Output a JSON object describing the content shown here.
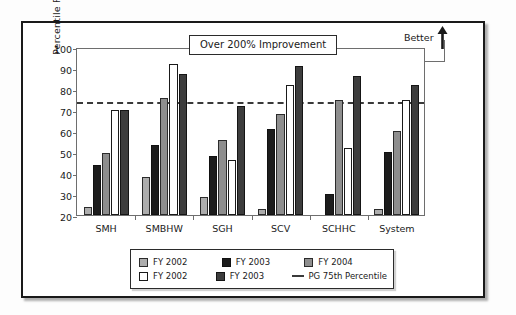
{
  "chart_data": {
    "type": "bar",
    "title": "",
    "xlabel": "",
    "ylabel": "Percentile Ranking",
    "ylim": [
      20,
      100
    ],
    "ytick_step": 10,
    "yticks": [
      20,
      30,
      40,
      50,
      60,
      70,
      80,
      90,
      100
    ],
    "grid": false,
    "legend_position": "bottom",
    "categories": [
      "SMH",
      "SMBHW",
      "SGH",
      "SCV",
      "SCHHC",
      "System"
    ],
    "series": [
      {
        "name": "FY 2002",
        "style": "light-gray-fill",
        "color": "#adadad",
        "values": [
          24,
          38,
          28.5,
          23,
          null,
          23
        ]
      },
      {
        "name": "FY 2003",
        "style": "black-fill",
        "color": "#1c1c1c",
        "values": [
          44,
          53.5,
          48,
          61,
          30,
          50
        ]
      },
      {
        "name": "FY 2004",
        "style": "mid-gray-fill",
        "color": "#8e8e8e",
        "values": [
          49.5,
          75.5,
          55.5,
          68,
          75,
          60
        ]
      },
      {
        "name": "FY 2002",
        "style": "white-fill",
        "color": "#ffffff",
        "values": [
          70,
          92,
          46,
          82,
          52,
          75
        ]
      },
      {
        "name": "FY 2003",
        "style": "dark-gray-fill",
        "color": "#3d3d3d",
        "values": [
          70,
          87,
          72,
          91,
          86,
          82
        ]
      }
    ],
    "reference_line": {
      "label": "PG 75th Percentile",
      "value": 75,
      "style": "dashed",
      "color": "#3a3a3a"
    },
    "annotations": [
      {
        "name": "improvement-callout",
        "text": "Over 200% Improvement"
      },
      {
        "name": "better-direction",
        "text": "Better",
        "icon": "up-arrow-icon"
      }
    ]
  },
  "legend": {
    "rows": [
      [
        {
          "label": "FY 2002",
          "swatch": "light-gray-fill"
        },
        {
          "label": "FY 2003",
          "swatch": "black-fill"
        },
        {
          "label": "FY 2004",
          "swatch": "mid-gray-fill"
        }
      ],
      [
        {
          "label": "FY 2002",
          "swatch": "white-fill"
        },
        {
          "label": "FY 2003",
          "swatch": "dark-gray-fill"
        },
        {
          "label": "PG 75th Percentile",
          "swatch": "dashed-line"
        }
      ]
    ]
  }
}
